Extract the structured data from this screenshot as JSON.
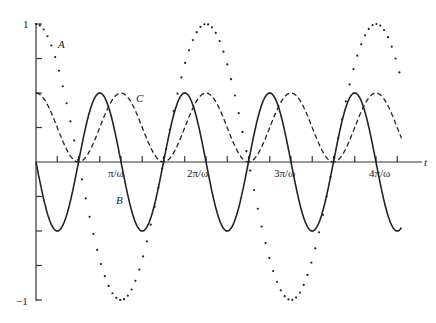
{
  "chart_data": {
    "type": "line",
    "title": "",
    "xlabel": "t",
    "ylabel": "",
    "ylim": [
      -1,
      1
    ],
    "xlim_in_pi_over_omega": [
      0,
      4.3
    ],
    "x_tick_labels": [
      "π/ω",
      "2π/ω",
      "3π/ω",
      "4π/ω"
    ],
    "y_tick_labels": [
      "1",
      "−1"
    ],
    "y_minor_ticks": [
      0.75,
      0.5,
      0.25,
      -0.25,
      -0.5,
      -0.75
    ],
    "x_minor_tick_step_pi_over_omega": 0.25,
    "grid": false,
    "series": [
      {
        "name": "A",
        "style": "dotted",
        "formula": "cos(ωt)",
        "amplitude": 1,
        "period_pi_over_omega": 2
      },
      {
        "name": "B",
        "style": "solid",
        "formula": "-0.5·sin(2ωt)",
        "amplitude": 0.5,
        "period_pi_over_omega": 1
      },
      {
        "name": "C",
        "style": "dashed",
        "formula": "0.5·cos²(ωt)",
        "amplitude": 0.5,
        "period_pi_over_omega": 1
      }
    ],
    "annotations": [
      {
        "text": "A",
        "near": "series A, upper left"
      },
      {
        "text": "B",
        "near": "series B, below π/ω"
      },
      {
        "text": "C",
        "near": "series C, at first dashed peak"
      }
    ]
  },
  "labels": {
    "y_top": "1",
    "y_bottom": "−1",
    "x_axis": "t",
    "xt1": "π/ω",
    "xt2": "2π/ω",
    "xt3": "3π/ω",
    "xt4": "4π/ω",
    "A": "A",
    "B": "B",
    "C": "C"
  }
}
